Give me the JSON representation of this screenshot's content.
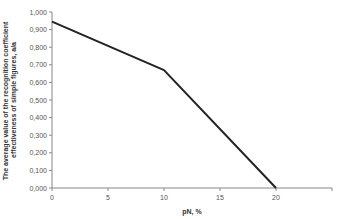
{
  "chart_data": {
    "type": "line",
    "title": "",
    "xlabel": "pN, %",
    "ylabel": "The average value of the recognition coefficient effectiveness of simple figures, a/a",
    "ylabel_lines": [
      "The average value of the recognition coefficient",
      "effectiveness of simple figures, a/a"
    ],
    "x": [
      0,
      10,
      20
    ],
    "series": [
      {
        "name": "recognition coefficient",
        "values": [
          0.945,
          0.67,
          0.0
        ]
      }
    ],
    "xlim": [
      0,
      25
    ],
    "ylim": [
      0,
      1
    ],
    "xticks": [
      0,
      5,
      10,
      15,
      20
    ],
    "xtick_labels": [
      "0",
      "5",
      "10",
      "15",
      "20"
    ],
    "yticks": [
      0,
      0.1,
      0.2,
      0.3,
      0.4,
      0.5,
      0.6,
      0.7,
      0.8,
      0.9,
      1.0
    ],
    "ytick_labels": [
      "0,000",
      "0,100",
      "0,200",
      "0,300",
      "0,400",
      "0,500",
      "0,600",
      "0,700",
      "0,800",
      "0,900",
      "1,000"
    ],
    "grid": false,
    "legend": "none",
    "colors": {
      "line": "#222222",
      "axis": "#888888",
      "text": "#444444"
    }
  }
}
